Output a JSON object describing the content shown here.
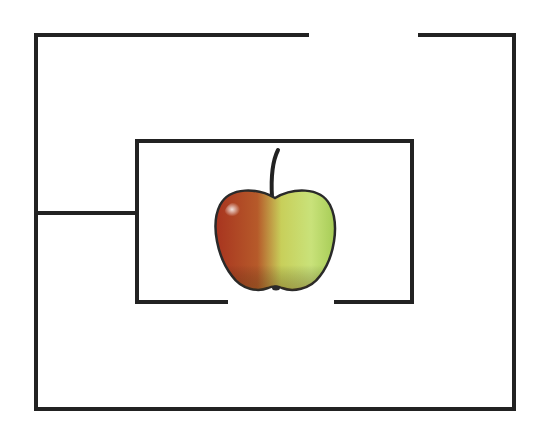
{
  "diagram": {
    "type": "maze",
    "wall_color": "#222222",
    "wall_width": 4,
    "outer_box": {
      "left": 36,
      "top": 35,
      "right": 514,
      "bottom": 409,
      "top_gap": {
        "from_x": 307,
        "to_x": 420
      }
    },
    "inner_box": {
      "left": 137,
      "top": 141,
      "right": 412,
      "bottom": 302,
      "bottom_gap": {
        "from_x": 226,
        "to_x": 336
      }
    },
    "connector_wall": {
      "x1": 36,
      "x2": 137,
      "y": 213
    },
    "goal": {
      "label": "apple",
      "cx": 275,
      "cy": 240,
      "colors": {
        "red": "#b03a20",
        "green": "#c4e070",
        "outline": "#2a2a2a",
        "stem": "#222222"
      }
    }
  }
}
